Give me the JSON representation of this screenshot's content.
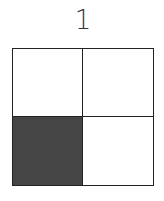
{
  "title": "1",
  "grid": {
    "rows": 2,
    "cols": 2,
    "cells": [
      {
        "row": 0,
        "col": 0,
        "filled": false
      },
      {
        "row": 0,
        "col": 1,
        "filled": false
      },
      {
        "row": 1,
        "col": 0,
        "filled": true
      },
      {
        "row": 1,
        "col": 1,
        "filled": false
      }
    ],
    "fill_color": "#454545",
    "line_color": "#222222"
  }
}
